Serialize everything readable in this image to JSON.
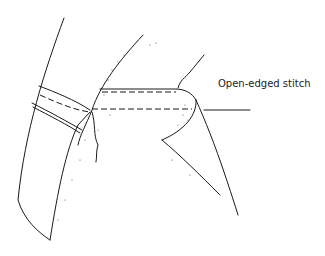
{
  "figure": {
    "type": "line-drawing",
    "labels": [
      {
        "text": "Open-edged stitch",
        "points_to": "seam edge"
      }
    ]
  }
}
